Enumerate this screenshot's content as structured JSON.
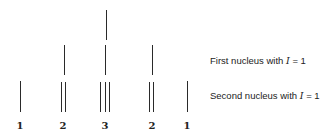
{
  "diagram": {
    "type": "nmr-splitting-tree",
    "row_labels": {
      "first": {
        "prefix": "First nucleus with ",
        "var": "I",
        "suffix": " = 1"
      },
      "second": {
        "prefix": "Second nucleus with ",
        "var": "I",
        "suffix": " = 1"
      }
    },
    "intensities": [
      "1",
      "2",
      "3",
      "2",
      "1"
    ],
    "colors": {
      "line": "#2a2a2a",
      "text": "#222222",
      "background": "#ffffff"
    }
  }
}
